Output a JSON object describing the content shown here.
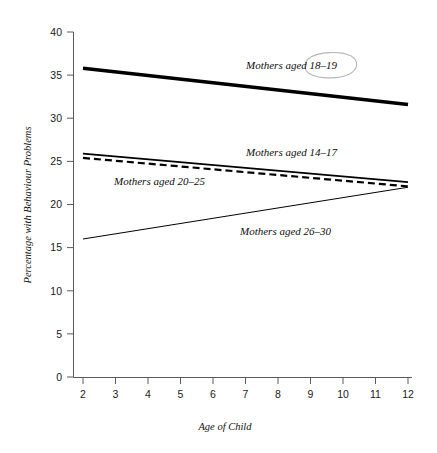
{
  "figure": {
    "xlabel": "Age of Child",
    "ylabel": "Percentage with Behaviour Problems",
    "x_ticks": [
      "2",
      "3",
      "4",
      "5",
      "6",
      "7",
      "8",
      "9",
      "10",
      "11",
      "12"
    ],
    "y_ticks": [
      "0",
      "5",
      "10",
      "15",
      "20",
      "25",
      "30",
      "35",
      "40"
    ],
    "annotation_circle": "circled-18-19"
  },
  "labels": {
    "s1": "Mothers aged 18–19",
    "s2": "Mothers aged 14–17",
    "s3": "Mothers aged 20–25",
    "s4": "Mothers aged 26–30"
  },
  "chart_data": {
    "type": "line",
    "title": "",
    "xlabel": "Age of Child",
    "ylabel": "Percentage with Behaviour Problems",
    "x": [
      2,
      12
    ],
    "xlim": [
      2,
      12
    ],
    "ylim": [
      0,
      40
    ],
    "xticks": [
      2,
      3,
      4,
      5,
      6,
      7,
      8,
      9,
      10,
      11,
      12
    ],
    "yticks": [
      0,
      5,
      10,
      15,
      20,
      25,
      30,
      35,
      40
    ],
    "grid": false,
    "legend": "inline-labels",
    "series": [
      {
        "name": "Mothers aged 18–19",
        "values": [
          35.8,
          31.6
        ],
        "style": "solid",
        "line_width_px": 3.6,
        "color": "#000000",
        "label_x": 9.0,
        "label_y": 35.3,
        "annotated": true
      },
      {
        "name": "Mothers aged 14–17",
        "values": [
          25.9,
          22.6
        ],
        "style": "solid",
        "line_width_px": 1.8,
        "color": "#000000",
        "label_x": 9.0,
        "label_y": 25.2,
        "annotated": false
      },
      {
        "name": "Mothers aged 20–25",
        "values": [
          25.4,
          22.1
        ],
        "style": "dashed",
        "line_width_px": 2.2,
        "color": "#000000",
        "label_x": 5.6,
        "label_y": 22.3,
        "annotated": false
      },
      {
        "name": "Mothers aged 26–30",
        "values": [
          16.0,
          22.0
        ],
        "style": "solid",
        "line_width_px": 1.0,
        "color": "#000000",
        "label_x": 9.0,
        "label_y": 17.6,
        "annotated": false
      }
    ],
    "annotations": [
      {
        "type": "hand-drawn-ellipse",
        "target": "Mothers aged 18–19",
        "target_text": "18–19",
        "color": "#b6b6b6"
      }
    ]
  }
}
